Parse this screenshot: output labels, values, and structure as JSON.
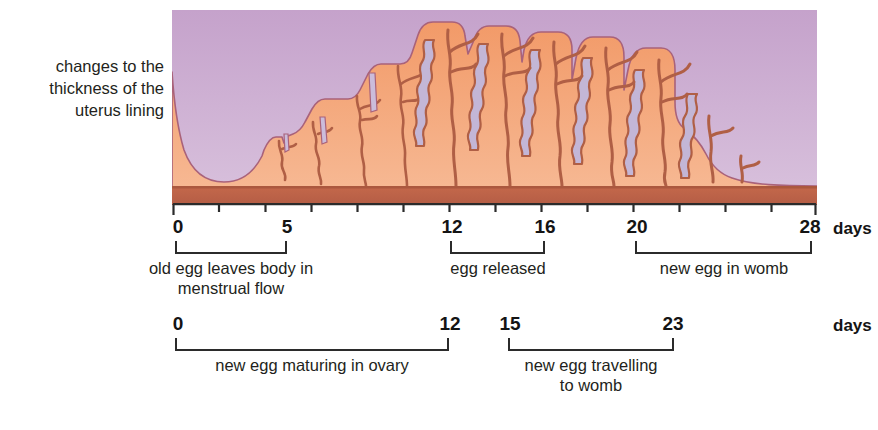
{
  "side_label": {
    "lines": [
      "changes to the",
      "thickness of the",
      "uterus lining"
    ]
  },
  "illustration": {
    "name": "uterus-lining-thickness-diagram",
    "colors": {
      "background_purple": "#c8a7cd",
      "background_purple_light": "#d7bcdb",
      "lining_orange": "#f0996a",
      "lining_orange_light": "#f6b38b",
      "muscle_band": "#c0664a",
      "outline": "#a9627a",
      "gland_stroke": "#b05f45"
    }
  },
  "timeline_1": {
    "unit_label": "days",
    "axis": {
      "min": 0,
      "max": 28,
      "tick_step": 2,
      "ticks": [
        0,
        2,
        4,
        6,
        8,
        10,
        12,
        14,
        16,
        18,
        20,
        22,
        24,
        26,
        28
      ]
    },
    "labeled_ticks": [
      {
        "value": 0,
        "text": "0"
      },
      {
        "value": 5,
        "text": "5"
      },
      {
        "value": 12,
        "text": "12"
      },
      {
        "value": 16,
        "text": "16"
      },
      {
        "value": 20,
        "text": "20"
      },
      {
        "value": 28,
        "text": "28"
      }
    ],
    "spans": [
      {
        "start": 0,
        "end": 5,
        "caption": [
          "old egg leaves body in",
          "menstrual flow"
        ]
      },
      {
        "start": 12,
        "end": 16,
        "caption": [
          "egg released"
        ]
      },
      {
        "start": 20,
        "end": 28,
        "caption": [
          "new egg in womb"
        ]
      }
    ]
  },
  "timeline_2": {
    "unit_label": "days",
    "axis": {
      "min": 0,
      "max": 28
    },
    "labeled_ticks": [
      {
        "value": 0,
        "text": "0"
      },
      {
        "value": 12,
        "text": "12"
      },
      {
        "value": 15,
        "text": "15"
      },
      {
        "value": 23,
        "text": "23"
      }
    ],
    "spans": [
      {
        "start": 0,
        "end": 12,
        "caption": [
          "new egg maturing in ovary"
        ]
      },
      {
        "start": 15,
        "end": 23,
        "caption": [
          "new egg travelling",
          "to womb"
        ]
      }
    ]
  }
}
